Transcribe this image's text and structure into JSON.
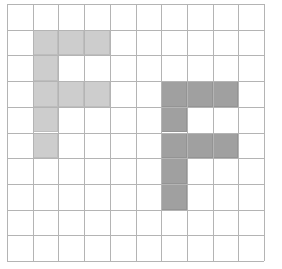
{
  "figure": {
    "type": "grid-shape-diagram",
    "background_color": "#ffffff"
  },
  "grid": {
    "columns": 10,
    "rows": 10,
    "cell_size_px": 25.7,
    "origin_x_px": 7,
    "origin_y_px": 4,
    "line_color": "#b4b4b4",
    "line_width_px": 1
  },
  "shapes": [
    {
      "name": "light-f-shape",
      "label": "Light gray letter F",
      "fill_color": "#cdcdcd",
      "stroke_color": "#bdbdbd",
      "cells": [
        [
          1,
          1
        ],
        [
          2,
          1
        ],
        [
          3,
          1
        ],
        [
          1,
          2
        ],
        [
          1,
          3
        ],
        [
          2,
          3
        ],
        [
          3,
          3
        ],
        [
          1,
          4
        ],
        [
          1,
          5
        ]
      ],
      "cell_count": 9
    },
    {
      "name": "dark-f-shape",
      "label": "Dark gray letter F",
      "fill_color": "#a0a0a0",
      "stroke_color": "#949494",
      "cells": [
        [
          6,
          3
        ],
        [
          7,
          3
        ],
        [
          8,
          3
        ],
        [
          6,
          4
        ],
        [
          6,
          5
        ],
        [
          7,
          5
        ],
        [
          8,
          5
        ],
        [
          6,
          6
        ],
        [
          6,
          7
        ]
      ],
      "cell_count": 9
    }
  ]
}
